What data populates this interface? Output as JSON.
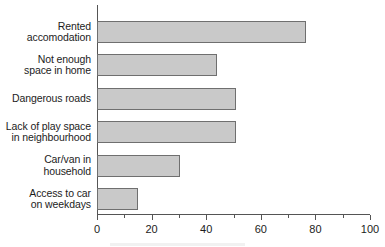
{
  "chart_data": {
    "type": "bar",
    "orientation": "horizontal",
    "title": "",
    "xlabel": "",
    "ylabel": "",
    "xlim": [
      0,
      100
    ],
    "grid": false,
    "legend": null,
    "categories": [
      "Rented accomodation",
      "Not enough space in home",
      "Dangerous roads",
      "Lack of play space in neighbourhood",
      "Car/van in household",
      "Access to car on weekdays"
    ],
    "category_lines": [
      [
        "Rented",
        "accomodation"
      ],
      [
        "Not enough",
        "space in home"
      ],
      [
        "Dangerous roads"
      ],
      [
        "Lack of play space",
        "in neighbourhood"
      ],
      [
        "Car/van in",
        "household"
      ],
      [
        "Access to car",
        "on weekdays"
      ]
    ],
    "values": [
      76.5,
      44,
      51,
      51,
      30.5,
      15
    ],
    "xticks": [
      0,
      20,
      40,
      60,
      80,
      100
    ],
    "xtick_labels": [
      "0",
      "20",
      "40",
      "60",
      "80",
      "100"
    ],
    "minor_xticks": [
      10,
      30,
      50,
      70,
      90
    ],
    "colors": {
      "bar_fill": "#c9c9c9",
      "bar_border": "#6f6f6f",
      "axis": "#555555",
      "text": "#1c1c1c",
      "background": "#ffffff"
    }
  }
}
